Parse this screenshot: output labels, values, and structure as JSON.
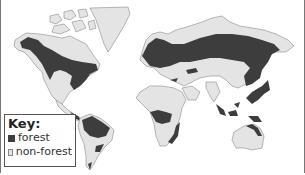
{
  "map": {
    "subject": "World forest distribution",
    "colors": {
      "forest": "#3d3d3d",
      "non_forest": "#e4e4e4",
      "ocean": "#ffffff",
      "outline": "#8a8a8a"
    },
    "regions": [
      "North America",
      "Greenland",
      "South America",
      "Europe",
      "Asia",
      "Africa",
      "Australia",
      "Southeast Asia"
    ]
  },
  "key": {
    "title": "Key:",
    "items": [
      {
        "label": "forest",
        "color": "#3d3d3d"
      },
      {
        "label": "non-forest",
        "color": "#e4e4e4"
      }
    ]
  }
}
